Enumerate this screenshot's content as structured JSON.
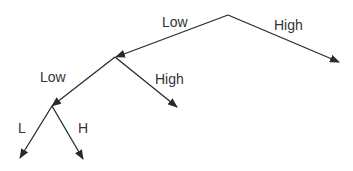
{
  "diagram": {
    "type": "binary-tree",
    "colors": {
      "line": "#2a2a2a",
      "text": "#333333",
      "background": "#ffffff"
    },
    "nodes": [
      {
        "id": "root",
        "x": 228,
        "y": 15
      },
      {
        "id": "n_low",
        "x": 115,
        "y": 57
      },
      {
        "id": "n_low_low",
        "x": 52,
        "y": 106
      }
    ],
    "edges": [
      {
        "id": "root-low",
        "label": "Low",
        "from": [
          228,
          15
        ],
        "to": [
          116,
          57
        ],
        "label_pos": [
          162,
          27
        ]
      },
      {
        "id": "root-high",
        "label": "High",
        "from": [
          228,
          15
        ],
        "to": [
          339,
          62
        ],
        "label_pos": [
          274,
          30
        ]
      },
      {
        "id": "low-low",
        "label": "Low",
        "from": [
          115,
          57
        ],
        "to": [
          52,
          106
        ],
        "label_pos": [
          40,
          82
        ]
      },
      {
        "id": "low-high",
        "label": "High",
        "from": [
          115,
          57
        ],
        "to": [
          177,
          107
        ],
        "label_pos": [
          155,
          84
        ]
      },
      {
        "id": "lowlow-l",
        "label": "L",
        "from": [
          52,
          106
        ],
        "to": [
          20,
          158
        ],
        "label_pos": [
          18,
          133
        ]
      },
      {
        "id": "lowlow-h",
        "label": "H",
        "from": [
          52,
          106
        ],
        "to": [
          83,
          159
        ],
        "label_pos": [
          78,
          133
        ]
      }
    ]
  }
}
